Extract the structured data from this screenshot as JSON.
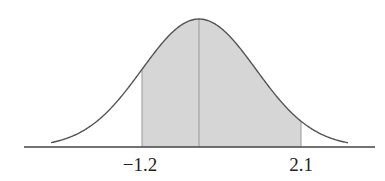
{
  "diagram": {
    "type": "normal-distribution-shaded-area",
    "labels": {
      "left_bound": "−1.2",
      "right_bound": "2.1"
    },
    "values": {
      "left_bound": -1.2,
      "right_bound": 2.1,
      "mean": 0
    },
    "colors": {
      "curve": "#555555",
      "shade": "#d6d6d6",
      "axis": "#444444",
      "boundary_lines": "#999999",
      "text": "#222222"
    }
  }
}
